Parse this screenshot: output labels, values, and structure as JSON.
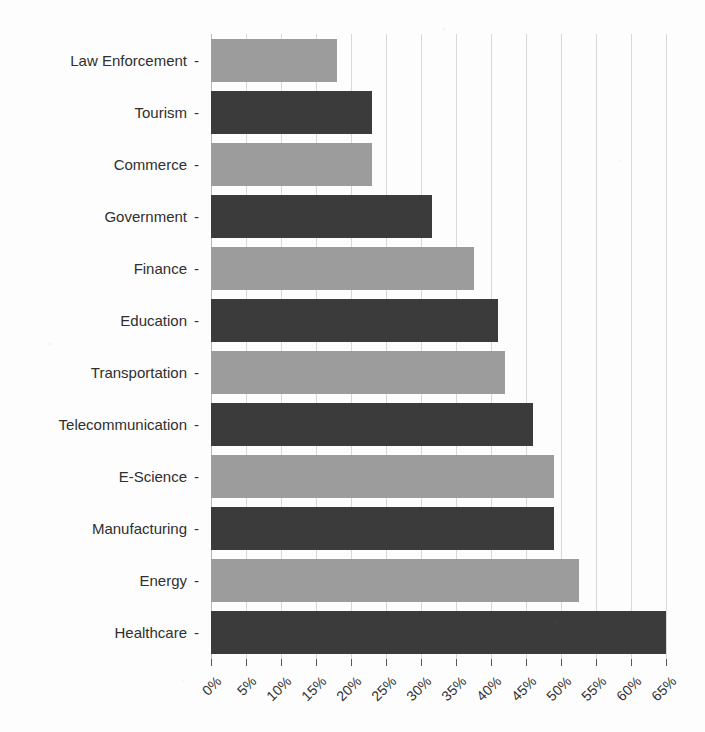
{
  "chart_data": {
    "type": "bar",
    "orientation": "horizontal",
    "title": "",
    "subtitle": "",
    "xlabel": "",
    "ylabel": "",
    "xlim": [
      0,
      65
    ],
    "ylim": null,
    "grid": true,
    "legend": null,
    "legend_position": "none",
    "xtick_labels": [
      "0%",
      "5%",
      "10%",
      "15%",
      "20%",
      "25%",
      "30%",
      "35%",
      "40%",
      "45%",
      "50%",
      "55%",
      "60%",
      "65%"
    ],
    "xtick_values": [
      0,
      5,
      10,
      15,
      20,
      25,
      30,
      35,
      40,
      45,
      50,
      55,
      60,
      65
    ],
    "xtick_rotation": -45,
    "categories": [
      "Law Enforcement",
      "Tourism",
      "Commerce",
      "Government",
      "Finance",
      "Education",
      "Transportation",
      "Telecommunication",
      "E-Science",
      "Manufacturing",
      "Energy",
      "Healthcare"
    ],
    "values": [
      18,
      23,
      23,
      31.5,
      37.5,
      41,
      42,
      46,
      49,
      49,
      52.5,
      65
    ],
    "value_labels": [
      "18%",
      "23%",
      "23%",
      "31.5%",
      "37.5%",
      "41%",
      "42%",
      "46%",
      "49%",
      "49%",
      "52.5%",
      "65%"
    ],
    "bar_colors": [
      "#9c9c9c",
      "#3b3b3b",
      "#9c9c9c",
      "#3b3b3b",
      "#9c9c9c",
      "#3b3b3b",
      "#9c9c9c",
      "#3b3b3b",
      "#9c9c9c",
      "#3b3b3b",
      "#9c9c9c",
      "#3b3b3b"
    ],
    "colors": {
      "bar_light": "#9c9c9c",
      "bar_dark": "#3b3b3b",
      "gridline": "#d8d8d8",
      "axis": "#b9b9b9",
      "text": "#2f2f2f",
      "background": "#fdfdfd"
    },
    "tick_dash": "-"
  }
}
